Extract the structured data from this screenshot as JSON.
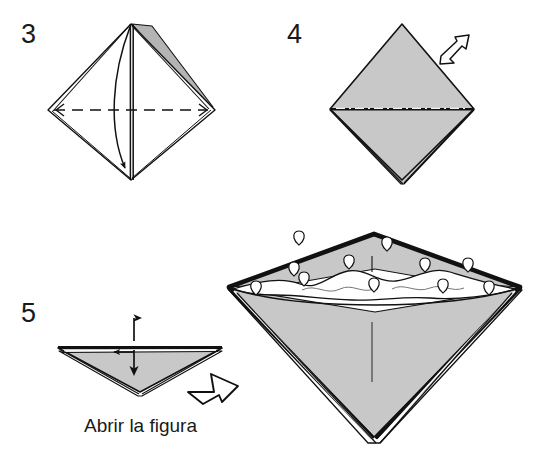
{
  "document": {
    "type": "origami-instruction-diagram",
    "language": "es",
    "background_color": "#ffffff",
    "ink_color": "#111111",
    "paper_gray": "#c8c8c8",
    "paper_white": "#ffffff"
  },
  "steps": [
    {
      "number": "3",
      "name": "step-3",
      "figure": "diamond-with-center-fold",
      "paper_fill": "#ffffff",
      "has_gray_flap": true,
      "gray_flap_fill": "#b4b4b4",
      "annotations": [
        {
          "type": "dashed-fold-line",
          "name": "horizontal-dashed-fold-line",
          "orientation": "horizontal"
        },
        {
          "type": "curved-arrow",
          "name": "curved-fold-arrow",
          "direction": "down-left"
        },
        {
          "type": "vertical-center-line",
          "name": "vertical-center-crease"
        }
      ]
    },
    {
      "number": "4",
      "name": "step-4",
      "figure": "gray-diamond",
      "paper_fill": "#c8c8c8",
      "annotations": [
        {
          "type": "dash-dot-line",
          "name": "horizontal-dash-dot-line",
          "orientation": "horizontal"
        },
        {
          "type": "hollow-arrow",
          "name": "open-here-hollow-arrow",
          "direction": "down-left"
        }
      ]
    },
    {
      "number": "5",
      "name": "step-5",
      "figure": "inverted-gray-triangle",
      "paper_fill": "#c8c8c8",
      "annotations": [
        {
          "type": "double-headed-arrow",
          "name": "open-vertical-double-arrow",
          "orientation": "vertical"
        },
        {
          "type": "hollow-arrow",
          "name": "result-hollow-arrow",
          "direction": "right"
        }
      ],
      "caption": "Abrir la figura"
    }
  ],
  "result_figure": {
    "name": "opened-vessel-figure",
    "description": "opened three-dimensional figure",
    "paper_fill": "#c8c8c8",
    "interior_fill": "#ffffff",
    "rim_marks_count": 11,
    "annotations": [
      {
        "type": "wavy-line",
        "name": "interior-wavy-line"
      },
      {
        "type": "tick-line",
        "name": "front-center-crease-tick"
      },
      {
        "type": "tick-line",
        "name": "rim-center-tick"
      }
    ]
  },
  "caption": {
    "text": "Abrir la figura"
  }
}
